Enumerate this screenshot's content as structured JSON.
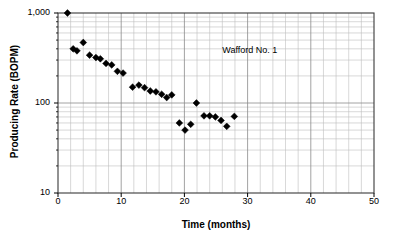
{
  "chart_data": {
    "type": "scatter",
    "title": "",
    "xlabel": "Time (months)",
    "ylabel": "Producing Rate (BOPM)",
    "xlim": [
      0,
      50
    ],
    "ylim": [
      10,
      1000
    ],
    "yscale": "log",
    "xscale": "linear",
    "grid": true,
    "legend": null,
    "xticks": [
      0,
      10,
      20,
      30,
      40,
      50
    ],
    "xtick_labels": [
      "0",
      "10",
      "20",
      "30",
      "40",
      "50"
    ],
    "yticks": [
      10,
      100,
      1000
    ],
    "ytick_labels": [
      "10",
      "100",
      "1,000"
    ],
    "x_minor_tick_step": 2,
    "annotations": [
      {
        "text": "Wafford No. 1",
        "x": 26.0,
        "y": 380
      }
    ],
    "series": [
      {
        "name": "Wafford No. 1",
        "marker": "diamond",
        "color": "#000000",
        "points": [
          {
            "x": 1.5,
            "y": 1000
          },
          {
            "x": 2.4,
            "y": 400
          },
          {
            "x": 3.0,
            "y": 380
          },
          {
            "x": 4.0,
            "y": 470
          },
          {
            "x": 5.0,
            "y": 340
          },
          {
            "x": 6.0,
            "y": 320
          },
          {
            "x": 6.7,
            "y": 310
          },
          {
            "x": 7.6,
            "y": 275
          },
          {
            "x": 8.5,
            "y": 265
          },
          {
            "x": 9.4,
            "y": 225
          },
          {
            "x": 10.3,
            "y": 215
          },
          {
            "x": 11.8,
            "y": 150
          },
          {
            "x": 12.8,
            "y": 158
          },
          {
            "x": 13.7,
            "y": 148
          },
          {
            "x": 14.6,
            "y": 136
          },
          {
            "x": 15.5,
            "y": 133
          },
          {
            "x": 16.4,
            "y": 125
          },
          {
            "x": 17.2,
            "y": 115
          },
          {
            "x": 18.0,
            "y": 123
          },
          {
            "x": 19.2,
            "y": 60
          },
          {
            "x": 20.1,
            "y": 50
          },
          {
            "x": 21.0,
            "y": 58
          },
          {
            "x": 21.9,
            "y": 100
          },
          {
            "x": 23.1,
            "y": 72
          },
          {
            "x": 24.0,
            "y": 72
          },
          {
            "x": 24.9,
            "y": 70
          },
          {
            "x": 25.8,
            "y": 64
          },
          {
            "x": 26.7,
            "y": 55
          },
          {
            "x": 27.9,
            "y": 71
          }
        ]
      }
    ]
  },
  "axes": {
    "x_title": "Time (months)",
    "y_title": "Producing Rate (BOPM)"
  },
  "labels": {
    "well_name": "Wafford No. 1"
  }
}
